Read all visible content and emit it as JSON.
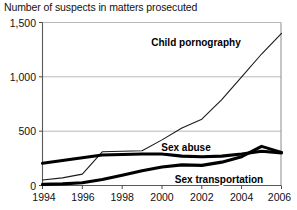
{
  "chart_title": "Number of suspects in matters prosecuted",
  "axes": {
    "y_ticks": [
      "0",
      "500",
      "1,000",
      "1,500"
    ],
    "x_ticks": [
      "1994",
      "1996",
      "1998",
      "2000",
      "2002",
      "2004",
      "2006"
    ]
  },
  "series_labels": {
    "child_pornography": "Child pornography",
    "sex_abuse": "Sex abuse",
    "sex_transportation": "Sex transportation"
  },
  "chart_data": {
    "type": "line",
    "title": "Number of suspects in matters prosecuted",
    "xlabel": "",
    "ylabel": "",
    "xlim": [
      1994,
      2006
    ],
    "ylim": [
      0,
      1500
    ],
    "yticks": [
      0,
      500,
      1000,
      1500
    ],
    "xticks": [
      1994,
      1996,
      1998,
      2000,
      2002,
      2004,
      2006
    ],
    "grid": true,
    "legend": "inline-labels",
    "x": [
      1994,
      1995,
      1996,
      1997,
      1998,
      1999,
      2000,
      2001,
      2002,
      2003,
      2004,
      2005,
      2006
    ],
    "series": [
      {
        "name": "Child pornography",
        "style": "thin",
        "values": [
          50,
          70,
          105,
          310,
          315,
          320,
          420,
          530,
          610,
          790,
          1000,
          1210,
          1400
        ]
      },
      {
        "name": "Sex abuse",
        "style": "bold",
        "values": [
          205,
          230,
          255,
          280,
          285,
          290,
          290,
          270,
          265,
          270,
          290,
          315,
          300
        ]
      },
      {
        "name": "Sex transportation",
        "style": "bold",
        "values": [
          10,
          15,
          25,
          55,
          95,
          135,
          170,
          190,
          185,
          215,
          265,
          360,
          305
        ]
      }
    ]
  }
}
